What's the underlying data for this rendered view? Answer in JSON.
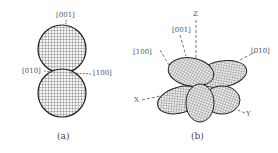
{
  "panel_a": {
    "caption": "(a)",
    "labels": {
      "top": "[001]",
      "left": "[010]",
      "right": "[100]"
    }
  },
  "panel_b": {
    "caption": "(b)",
    "labels": {
      "z": "Z",
      "dir001": "[001]",
      "dir100": "[100]",
      "dir010": "[010]",
      "x": "X",
      "y": "Y"
    }
  }
}
